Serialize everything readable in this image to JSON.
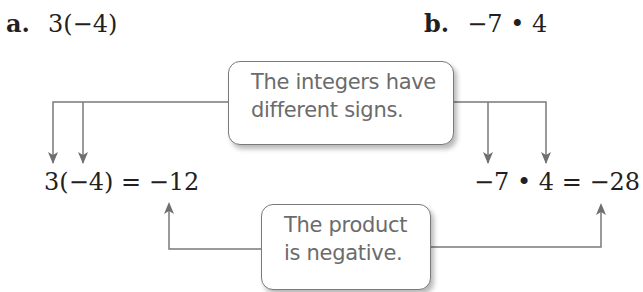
{
  "problems": {
    "a": {
      "label": "a.",
      "expression": "3(−4)"
    },
    "b": {
      "label": "b.",
      "expression": "−7 • 4"
    }
  },
  "equations": {
    "a": "3(−4) = −12",
    "b": "−7 • 4 = −28"
  },
  "callouts": {
    "top": {
      "line1": "The integers have",
      "line2": "different signs."
    },
    "bottom": {
      "line1": "The product",
      "line2": "is negative."
    }
  },
  "colors": {
    "text": "#231f20",
    "connector": "#7a7a7a",
    "callout_text": "#6b6b6b",
    "callout_border": "#7a7a7a"
  }
}
